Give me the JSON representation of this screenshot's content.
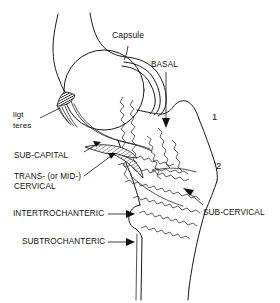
{
  "figure": {
    "background_color": "#ffffff",
    "ink_color": "#111111"
  },
  "labels": {
    "capsule": "Capsule",
    "basal": "BASAL",
    "ligt_teres_line1": "ligt",
    "ligt_teres_line2": "teres",
    "sub_capital": "SUB-CAPITAL",
    "trans_cervical_line1": "TRANS- (or MID-)",
    "trans_cervical_line2": "CERVICAL",
    "intertrochanteric": "INTERTROCHANTERIC",
    "subtrochanteric": "SUBTROCHANTERIC",
    "sub_cervical": "SUB-CERVICAL",
    "marker_one": "1",
    "marker_two": "2"
  },
  "structures": {
    "femoral_head": "femoral-head",
    "acetabulum": "acetabulum",
    "joint_capsule": "joint-capsule",
    "ligamentum_teres": "ligamentum-teres",
    "greater_trochanter": "greater-trochanter",
    "lesser_trochanter": "lesser-trochanter",
    "femoral_neck": "femoral-neck",
    "femoral_shaft": "femoral-shaft",
    "sub_capital_wedge": "sub-capital-wedge",
    "trans_cervical_wedge": "trans-cervical-wedge"
  }
}
